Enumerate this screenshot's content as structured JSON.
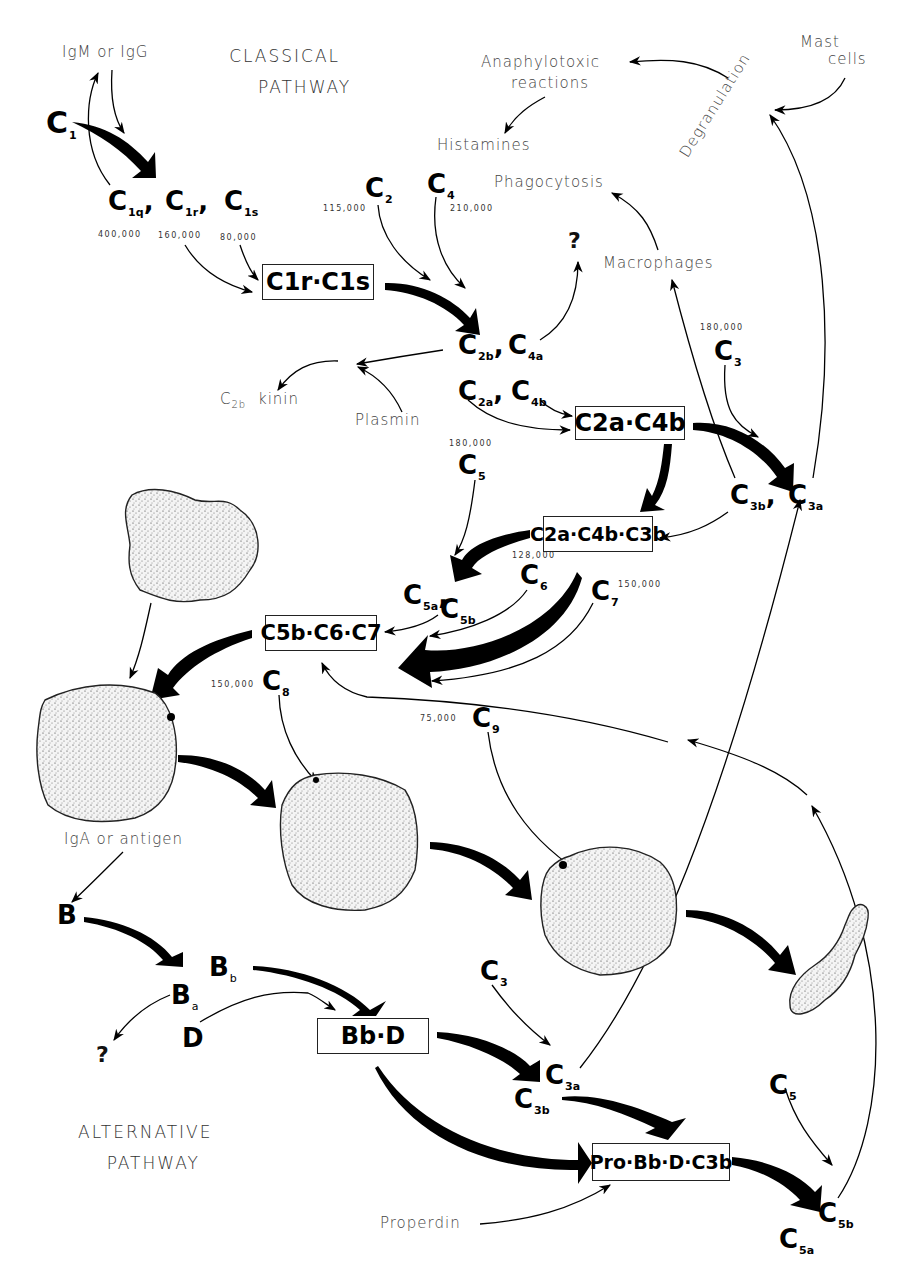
{
  "titles": {
    "classical": "CLASSICAL\nPATHWAY",
    "classical_line1": "CLASSICAL",
    "classical_line2": "PATHWAY",
    "alternative_line1": "ALTERNATIVE",
    "alternative_line2": "PATHWAY"
  },
  "labels": {
    "igm_or_igg": "IgM or IgG",
    "anaphylotoxic_line1": "Anaphylotoxic",
    "anaphylotoxic_line2": "reactions",
    "histamines": "Histamines",
    "phagocytosis": "Phagocytosis",
    "macrophages": "Macrophages",
    "degranulation": "Degranulation",
    "mast_line1": "Mast",
    "mast_line2": "cells",
    "c2b_kinin_prefix": "C",
    "c2b_kinin_sub": "2b",
    "c2b_kinin_suffix": "kinin",
    "plasmin": "Plasmin",
    "iga_or_antigen": "IgA or antigen",
    "properdin": "Properdin",
    "question_1": "?",
    "question_2": "?"
  },
  "molecular_weights": {
    "c1q": "400,000",
    "c1r": "160,000",
    "c1s": "80,000",
    "c2": "115,000",
    "c4": "210,000",
    "c3": "180,000",
    "c5": "180,000",
    "c6": "128,000",
    "c7": "150,000",
    "c8": "150,000",
    "c9": "75,000"
  },
  "components": {
    "c1": {
      "base": "C",
      "sub": "1"
    },
    "c1q": {
      "base": "C",
      "sub": "1q"
    },
    "c1r": {
      "base": "C",
      "sub": "1r"
    },
    "c1s": {
      "base": "C",
      "sub": "1s"
    },
    "c2": {
      "base": "C",
      "sub": "2"
    },
    "c4": {
      "base": "C",
      "sub": "4"
    },
    "c2b": {
      "base": "C",
      "sub": "2b"
    },
    "c4a": {
      "base": "C",
      "sub": "4a"
    },
    "c2a": {
      "base": "C",
      "sub": "2a"
    },
    "c4b": {
      "base": "C",
      "sub": "4b"
    },
    "c3": {
      "base": "C",
      "sub": "3"
    },
    "c3b": {
      "base": "C",
      "sub": "3b"
    },
    "c3a": {
      "base": "C",
      "sub": "3a"
    },
    "c5": {
      "base": "C",
      "sub": "5"
    },
    "c5a": {
      "base": "C",
      "sub": "5a"
    },
    "c5b": {
      "base": "C",
      "sub": "5b"
    },
    "c6": {
      "base": "C",
      "sub": "6"
    },
    "c7": {
      "base": "C",
      "sub": "7"
    },
    "c8": {
      "base": "C",
      "sub": "8"
    },
    "c9": {
      "base": "C",
      "sub": "9"
    },
    "b": {
      "base": "B"
    },
    "bb": {
      "base": "B",
      "sub": "b"
    },
    "ba": {
      "base": "B",
      "sub": "a"
    },
    "d": {
      "base": "D"
    },
    "alt_c3": {
      "base": "C",
      "sub": "3"
    },
    "alt_c3a": {
      "base": "C",
      "sub": "3a"
    },
    "alt_c3b": {
      "base": "C",
      "sub": "3b"
    },
    "alt_c5": {
      "base": "C",
      "sub": "5"
    },
    "alt_c5a": {
      "base": "C",
      "sub": "5a"
    },
    "alt_c5b": {
      "base": "C",
      "sub": "5b"
    }
  },
  "complexes": {
    "c1r_c1s": "C1r·C1s",
    "c2a_c4b": "C2a·C4b",
    "c2a_c4b_c3b": "C2a·C4b·C3b",
    "c5b_c6_c7": "C5b·C6·C7",
    "bb_d": "Bb·D",
    "pro_bb_d_c3b": "Pro·Bb·D·C3b"
  },
  "colors": {
    "ink": "#000000",
    "thin_text": "#444444",
    "cell_fill": "#f3f3f3",
    "background": "#ffffff"
  }
}
